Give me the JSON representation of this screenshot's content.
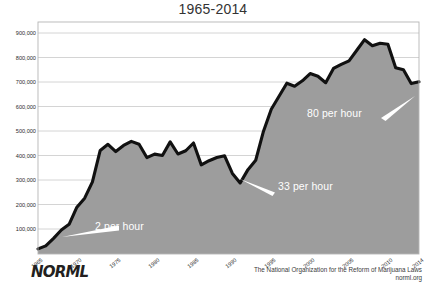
{
  "subtitle": "1965-2014",
  "logo_text": "NORML",
  "credit": {
    "line1": "The National Organization for the Reform of Marijuana Laws",
    "line2": "norml.org"
  },
  "colors": {
    "area_fill": "#9d9d9d",
    "line": "#111111",
    "background": "#ffffff",
    "gridline": "#c9c9c9",
    "annotation_text": "#ffffff",
    "tick_text": "#2b2b2b",
    "subtitle_text": "#333333"
  },
  "annotations": [
    {
      "id": "rate-1965",
      "label": "2 per hour",
      "x": 95,
      "y": 220
    },
    {
      "id": "rate-1991",
      "label": "33 per hour",
      "x": 278,
      "y": 180
    },
    {
      "id": "rate-2007",
      "label": "80 per hour",
      "x": 307,
      "y": 107
    }
  ],
  "chart_data": {
    "type": "area",
    "title": "",
    "subtitle": "1965-2014",
    "xlabel": "",
    "ylabel": "",
    "grid": true,
    "legend": "none",
    "xlim": [
      1965,
      2014
    ],
    "ylim": [
      0,
      950000
    ],
    "yticks": [
      "100,000",
      "200,000",
      "300,000",
      "400,000",
      "500,000",
      "600,000",
      "700,000",
      "800,000",
      "900,000"
    ],
    "ytick_values": [
      100000,
      200000,
      300000,
      400000,
      500000,
      600000,
      700000,
      800000,
      900000
    ],
    "xticks": [
      "1965",
      "1970",
      "1975",
      "1980",
      "1985",
      "1990",
      "1995",
      "2000",
      "2005",
      "2010",
      "2014"
    ],
    "xtick_values": [
      1965,
      1970,
      1975,
      1980,
      1985,
      1990,
      1995,
      2000,
      2005,
      2010,
      2014
    ],
    "series": [
      {
        "name": "Marijuana Arrests",
        "x": [
          1965,
          1966,
          1967,
          1968,
          1969,
          1970,
          1971,
          1972,
          1973,
          1974,
          1975,
          1976,
          1977,
          1978,
          1979,
          1980,
          1981,
          1982,
          1983,
          1984,
          1985,
          1986,
          1987,
          1988,
          1989,
          1990,
          1991,
          1992,
          1993,
          1994,
          1995,
          1996,
          1997,
          1998,
          1999,
          2000,
          2001,
          2002,
          2003,
          2004,
          2005,
          2006,
          2007,
          2008,
          2009,
          2010,
          2011,
          2012,
          2013,
          2014
        ],
        "values": [
          18815,
          31119,
          61843,
          95870,
          118903,
          188903,
          225828,
          292179,
          420700,
          445600,
          416100,
          441100,
          457600,
          445800,
          391600,
          405600,
          400300,
          455600,
          406000,
          419400,
          451100,
          361800,
          378700,
          391600,
          398900,
          326900,
          287900,
          342300,
          380700,
          499100,
          588900,
          641600,
          695200,
          682900,
          704800,
          734500,
          723600,
          697100,
          755200,
          771600,
          786500,
          829600,
          872700,
          847800,
          858400,
          853800,
          757900,
          749800,
          693500,
          700990
        ]
      }
    ],
    "rate_callouts": [
      {
        "year": 1965,
        "label": "2 per hour"
      },
      {
        "year": 1991,
        "label": "33 per hour"
      },
      {
        "year": 2007,
        "label": "80 per hour"
      }
    ]
  }
}
